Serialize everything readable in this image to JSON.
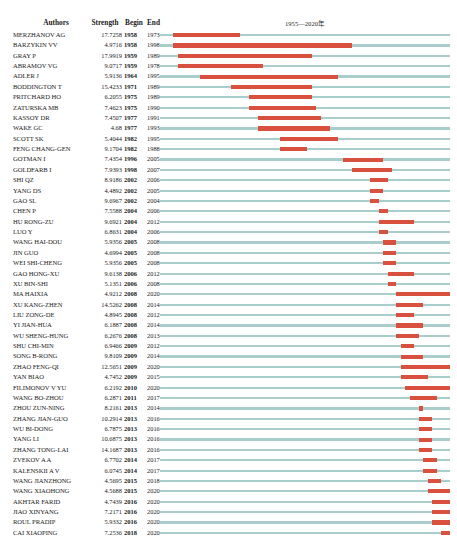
{
  "header": {
    "authors": "Authors",
    "strength": "Strength",
    "begin": "Begin",
    "end": "End",
    "year_range": "1955—2020年"
  },
  "colors": {
    "track": "#a9cdcb",
    "burst": "#d9503f",
    "text": "#1a1a1a"
  },
  "chart_data": {
    "type": "bar",
    "xlabel": "1955—2020年",
    "ylabel": "Authors",
    "xlim": [
      1955,
      2020
    ],
    "grid": false,
    "legend": "none",
    "columns": [
      "Authors",
      "Strength",
      "Begin",
      "End"
    ],
    "rows": [
      {
        "author": "MERZHANOV AG",
        "strength": "17.7258",
        "begin": "1958",
        "end": "1973"
      },
      {
        "author": "BARZYKIN VV",
        "strength": "4.9716",
        "begin": "1958",
        "end": "1998"
      },
      {
        "author": "GRAY P",
        "strength": "17.9919",
        "begin": "1959",
        "end": "1989"
      },
      {
        "author": "ABRAMOV VG",
        "strength": "9.0717",
        "begin": "1959",
        "end": "1978"
      },
      {
        "author": "ADLER J",
        "strength": "5.9136",
        "begin": "1964",
        "end": "1995"
      },
      {
        "author": "BODDINGTON T",
        "strength": "15.4233",
        "begin": "1971",
        "end": "1989"
      },
      {
        "author": "PRITCHARD HO",
        "strength": "6.2055",
        "begin": "1975",
        "end": "1989"
      },
      {
        "author": "ZATURSKA MB",
        "strength": "7.4623",
        "begin": "1975",
        "end": "1990"
      },
      {
        "author": "KASSOY DR",
        "strength": "7.4507",
        "begin": "1977",
        "end": "1991"
      },
      {
        "author": "WAKE GC",
        "strength": "4.68",
        "begin": "1977",
        "end": "1993"
      },
      {
        "author": "SCOTT SK",
        "strength": "5.4044",
        "begin": "1982",
        "end": "1995"
      },
      {
        "author": "FENG CHANG-GEN",
        "strength": "9.1704",
        "begin": "1982",
        "end": "1988"
      },
      {
        "author": "GOTMAN I",
        "strength": "7.4354",
        "begin": "1996",
        "end": "2005"
      },
      {
        "author": "GOLDFARB I",
        "strength": "7.9393",
        "begin": "1998",
        "end": "2007"
      },
      {
        "author": "SHI QZ",
        "strength": "8.9186",
        "begin": "2002",
        "end": "2006"
      },
      {
        "author": "YANG DS",
        "strength": "4.4892",
        "begin": "2002",
        "end": "2005"
      },
      {
        "author": "GAO SL",
        "strength": "9.6967",
        "begin": "2002",
        "end": "2004"
      },
      {
        "author": "CHEN P",
        "strength": "7.5588",
        "begin": "2004",
        "end": "2006"
      },
      {
        "author": "HU RONG-ZU",
        "strength": "9.6921",
        "begin": "2004",
        "end": "2012"
      },
      {
        "author": "LUO Y",
        "strength": "6.8631",
        "begin": "2004",
        "end": "2006"
      },
      {
        "author": "WANG HAI-DOU",
        "strength": "5.9356",
        "begin": "2005",
        "end": "2008"
      },
      {
        "author": "JIN GUO",
        "strength": "4.6994",
        "begin": "2005",
        "end": "2008"
      },
      {
        "author": "WEI SHI-CHENG",
        "strength": "5.9356",
        "begin": "2005",
        "end": "2008"
      },
      {
        "author": "GAO HONG-XU",
        "strength": "9.6138",
        "begin": "2006",
        "end": "2012"
      },
      {
        "author": "XU BIN-SHI",
        "strength": "5.1351",
        "begin": "2006",
        "end": "2008"
      },
      {
        "author": "MA HAIXIA",
        "strength": "4.9212",
        "begin": "2008",
        "end": "2020"
      },
      {
        "author": "XU KANG-ZHEN",
        "strength": "14.5262",
        "begin": "2008",
        "end": "2014"
      },
      {
        "author": "LIU ZONG-DE",
        "strength": "4.8945",
        "begin": "2008",
        "end": "2012"
      },
      {
        "author": "YI JIAN-HUA",
        "strength": "6.1887",
        "begin": "2008",
        "end": "2014"
      },
      {
        "author": "WU SHENG-HUNG",
        "strength": "6.2676",
        "begin": "2008",
        "end": "2013"
      },
      {
        "author": "SHU CHI-MIN",
        "strength": "6.9466",
        "begin": "2009",
        "end": "2012"
      },
      {
        "author": "SONG B-RONG",
        "strength": "9.8109",
        "begin": "2009",
        "end": "2014"
      },
      {
        "author": "ZHAO FENG-QI",
        "strength": "12.5651",
        "begin": "2009",
        "end": "2020"
      },
      {
        "author": "YAN BIAO",
        "strength": "4.7452",
        "begin": "2009",
        "end": "2015"
      },
      {
        "author": "FILIMONOV V YU",
        "strength": "6.2192",
        "begin": "2010",
        "end": "2020"
      },
      {
        "author": "WANG BO-ZHOU",
        "strength": "6.2871",
        "begin": "2011",
        "end": "2017"
      },
      {
        "author": "ZHOU ZUN-NING",
        "strength": "8.2161",
        "begin": "2013",
        "end": "2014"
      },
      {
        "author": "ZHANG JIAN-GUO",
        "strength": "10.2914",
        "begin": "2013",
        "end": "2016"
      },
      {
        "author": "WU BI-DONG",
        "strength": "6.7875",
        "begin": "2013",
        "end": "2016"
      },
      {
        "author": "YANG LI",
        "strength": "10.6875",
        "begin": "2013",
        "end": "2016"
      },
      {
        "author": "ZHANG TONG-LAI",
        "strength": "14.1687",
        "begin": "2013",
        "end": "2016"
      },
      {
        "author": "ZVEKOV A A",
        "strength": "6.7702",
        "begin": "2014",
        "end": "2017"
      },
      {
        "author": "KALENSKII A V",
        "strength": "6.0745",
        "begin": "2014",
        "end": "2017"
      },
      {
        "author": "WANG JIANZHONG",
        "strength": "4.5695",
        "begin": "2015",
        "end": "2018"
      },
      {
        "author": "WANG XIAOHONG",
        "strength": "4.5688",
        "begin": "2015",
        "end": "2020"
      },
      {
        "author": "AKHTAR FARID",
        "strength": "4.7439",
        "begin": "2016",
        "end": "2020"
      },
      {
        "author": "JIAO XINYANG",
        "strength": "7.2171",
        "begin": "2016",
        "end": "2020"
      },
      {
        "author": "ROUL PRADIP",
        "strength": "5.9332",
        "begin": "2016",
        "end": "2020"
      },
      {
        "author": "CAI XIAOPING",
        "strength": "7.2536",
        "begin": "2018",
        "end": "2020"
      }
    ]
  }
}
